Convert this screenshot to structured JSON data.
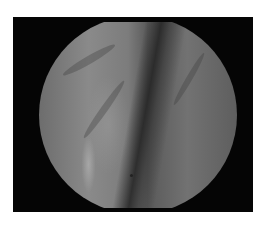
{
  "image": {
    "description": "Grayscale endoscopic view in circular field, black rectangular frame on white background",
    "colors": {
      "background": "#ffffff",
      "frame": "#050505",
      "tissue_light": "#8a8a8a",
      "tissue_dark": "#3a3a3a"
    }
  }
}
